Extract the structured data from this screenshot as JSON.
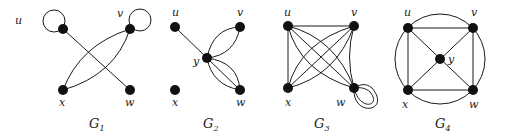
{
  "figure": {
    "graphs": [
      {
        "name": "G",
        "subscript": "1",
        "vertices": [
          {
            "id": "u",
            "label": "u"
          },
          {
            "id": "v",
            "label": "v"
          },
          {
            "id": "x",
            "label": "x"
          },
          {
            "id": "w",
            "label": "w"
          }
        ],
        "edges": [
          [
            "u",
            "u"
          ],
          [
            "v",
            "v"
          ],
          [
            "u",
            "w"
          ],
          [
            "v",
            "x"
          ],
          [
            "v",
            "x"
          ]
        ]
      },
      {
        "name": "G",
        "subscript": "2",
        "vertices": [
          {
            "id": "u",
            "label": "u"
          },
          {
            "id": "v",
            "label": "v"
          },
          {
            "id": "y",
            "label": "y"
          },
          {
            "id": "x",
            "label": "x"
          },
          {
            "id": "w",
            "label": "w"
          }
        ],
        "edges": [
          [
            "u",
            "y"
          ],
          [
            "y",
            "v"
          ],
          [
            "y",
            "v"
          ],
          [
            "y",
            "w"
          ],
          [
            "y",
            "w"
          ],
          [
            "y",
            "w"
          ]
        ]
      },
      {
        "name": "G",
        "subscript": "3",
        "vertices": [
          {
            "id": "u",
            "label": "u"
          },
          {
            "id": "v",
            "label": "v"
          },
          {
            "id": "x",
            "label": "x"
          },
          {
            "id": "w",
            "label": "w"
          }
        ],
        "edges": [
          [
            "u",
            "v"
          ],
          [
            "u",
            "x"
          ],
          [
            "u",
            "w"
          ],
          [
            "u",
            "w"
          ],
          [
            "u",
            "w"
          ],
          [
            "x",
            "v"
          ],
          [
            "x",
            "v"
          ],
          [
            "x",
            "v"
          ],
          [
            "v",
            "w"
          ],
          [
            "w",
            "w"
          ],
          [
            "w",
            "w"
          ]
        ]
      },
      {
        "name": "G",
        "subscript": "4",
        "vertices": [
          {
            "id": "u",
            "label": "u"
          },
          {
            "id": "v",
            "label": "v"
          },
          {
            "id": "y",
            "label": "y"
          },
          {
            "id": "x",
            "label": "x"
          },
          {
            "id": "w",
            "label": "w"
          }
        ],
        "edges": [
          [
            "u",
            "v"
          ],
          [
            "v",
            "w"
          ],
          [
            "w",
            "x"
          ],
          [
            "x",
            "u"
          ],
          [
            "u",
            "y"
          ],
          [
            "v",
            "y"
          ],
          [
            "w",
            "y"
          ],
          [
            "x",
            "y"
          ],
          [
            "u",
            "v"
          ],
          [
            "v",
            "w"
          ],
          [
            "w",
            "x"
          ],
          [
            "x",
            "u"
          ]
        ]
      }
    ]
  },
  "labels": {
    "g1": {
      "name": "G",
      "sub": "1",
      "u": "u",
      "v": "v",
      "x": "x",
      "w": "w"
    },
    "g2": {
      "name": "G",
      "sub": "2",
      "u": "u",
      "v": "v",
      "y": "y",
      "x": "x",
      "w": "w"
    },
    "g3": {
      "name": "G",
      "sub": "3",
      "u": "u",
      "v": "v",
      "x": "x",
      "w": "w"
    },
    "g4": {
      "name": "G",
      "sub": "4",
      "u": "u",
      "v": "v",
      "y": "y",
      "x": "x",
      "w": "w"
    }
  }
}
